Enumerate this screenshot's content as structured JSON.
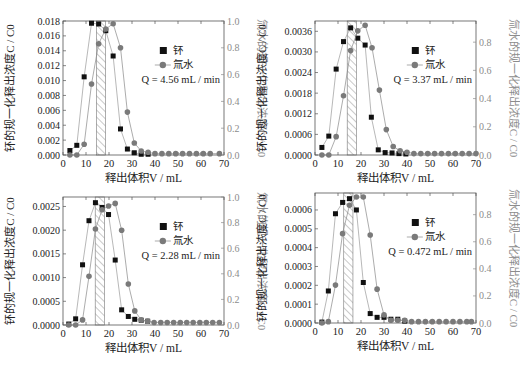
{
  "figure": {
    "x_axis_label": "释出体积V / mL",
    "left_axis_label": "钚的规一化释出浓度C / C0",
    "right_axis_label": "氚水的规一化释出浓度C / C0",
    "legend": [
      "钚",
      "氚水"
    ]
  },
  "chart_data": [
    {
      "type": "scatter",
      "panel": "top-left",
      "annotation": "Q = 4.56 mL / min",
      "xlabel": "释出体积V / mL",
      "ylabel_left": "钚的规一化释出浓度C / C0",
      "ylabel_right": "氚水的规一化释出浓度C / C0",
      "xlim": [
        0,
        70
      ],
      "xticks": [
        0,
        10,
        20,
        30,
        40,
        50,
        60,
        70
      ],
      "ylim_left": [
        0,
        0.018
      ],
      "yticks_left": [
        "0.000",
        "0.002",
        "0.004",
        "0.006",
        "0.008",
        "0.010",
        "0.012",
        "0.014",
        "0.016",
        "0.018"
      ],
      "ylim_right": [
        0,
        1.0
      ],
      "yticks_right": [
        "0.0",
        "0.2",
        "0.4",
        "0.6",
        "0.8",
        "1.0"
      ],
      "hatch_region": [
        14.5,
        18.5
      ],
      "series": [
        {
          "name": "钚",
          "axis": "left",
          "marker": "square",
          "x": [
            3,
            6,
            9.2,
            12.4,
            15.5,
            18.6,
            21.8,
            25,
            28,
            31,
            34,
            37
          ],
          "y": [
            0.0006,
            0.0013,
            0.0105,
            0.0177,
            0.0176,
            0.0167,
            0.0133,
            0.0035,
            0.0008,
            0.0003,
            0.0001,
            0.0001
          ]
        },
        {
          "name": "氚水",
          "axis": "right",
          "marker": "circle",
          "x": [
            3,
            6,
            9.2,
            12.4,
            15.5,
            18.6,
            21.8,
            25,
            28,
            31,
            34,
            37,
            40,
            43,
            46,
            49,
            52,
            55,
            58,
            61,
            64,
            68
          ],
          "y": [
            0.0,
            0.0,
            0.08,
            0.53,
            0.83,
            0.94,
            0.98,
            0.8,
            0.32,
            0.09,
            0.03,
            0.02,
            0.01,
            0.01,
            0.01,
            0.01,
            0.01,
            0.01,
            0.01,
            0.01,
            0.01,
            0.01
          ]
        }
      ]
    },
    {
      "type": "scatter",
      "panel": "top-right",
      "annotation": "Q = 3.37 mL / min",
      "xlabel": "释出体积V / mL",
      "xlim": [
        0,
        70
      ],
      "xticks": [
        0,
        10,
        20,
        30,
        40,
        50,
        60,
        70
      ],
      "ylim_left": [
        0,
        0.0039
      ],
      "yticks_left": [
        "0.0000",
        "0.0006",
        "0.0012",
        "0.0018",
        "0.0024",
        "0.0030",
        "0.0036"
      ],
      "ylim_right": [
        0,
        0.95
      ],
      "yticks_right": [
        "0.0",
        "0.2",
        "0.4",
        "0.6",
        "0.8"
      ],
      "hatch_region": [
        14,
        18
      ],
      "series": [
        {
          "name": "钚",
          "axis": "left",
          "marker": "square",
          "x": [
            3,
            6,
            9.2,
            12.4,
            15.5,
            18.6,
            21.8,
            24.5,
            27.5,
            30.5,
            33.5,
            36.5,
            39.5
          ],
          "y": [
            0.00022,
            0.00055,
            0.0025,
            0.0033,
            0.0037,
            0.0034,
            0.0032,
            0.0011,
            0.00015,
            7e-05,
            6e-05,
            4e-05,
            3e-05
          ]
        },
        {
          "name": "氚水",
          "axis": "right",
          "marker": "circle",
          "x": [
            3,
            6,
            9.2,
            12.4,
            15.5,
            18.6,
            21.8,
            24.8,
            28,
            31,
            34,
            37,
            40,
            43,
            46,
            49,
            52,
            55,
            58,
            61,
            64,
            67,
            70
          ],
          "y": [
            0.0,
            0.0,
            0.13,
            0.42,
            0.74,
            0.88,
            0.92,
            0.76,
            0.46,
            0.18,
            0.06,
            0.03,
            0.02,
            0.01,
            0.01,
            0.01,
            0.01,
            0.01,
            0.01,
            0.01,
            0.01,
            0.01,
            0.01
          ]
        }
      ]
    },
    {
      "type": "scatter",
      "panel": "bottom-left",
      "annotation": "Q = 2.28 mL / min",
      "xlabel": "释出体积V / mL",
      "xlim": [
        0,
        70
      ],
      "xticks": [
        0,
        10,
        20,
        30,
        40,
        50,
        60,
        70
      ],
      "ylim_left": [
        0,
        0.0027
      ],
      "yticks_left": [
        "0.0000",
        "0.0005",
        "0.0010",
        "0.0015",
        "0.0020",
        "0.0025"
      ],
      "ylim_right": [
        0,
        1.0
      ],
      "yticks_right": [
        "0.0",
        "0.2",
        "0.4",
        "0.6",
        "0.8",
        "1.0"
      ],
      "hatch_region": [
        14,
        18
      ],
      "series": [
        {
          "name": "钚",
          "axis": "left",
          "marker": "square",
          "x": [
            2.5,
            5.5,
            8.5,
            11.3,
            14.1,
            17,
            19.8,
            22.7,
            25.5,
            28.4,
            31.2,
            34,
            36.8
          ],
          "y": [
            2e-05,
            0.00013,
            0.00127,
            0.0022,
            0.00258,
            0.00248,
            0.00233,
            0.00137,
            0.00032,
            0.00018,
            0.00012,
            0.0001,
            8e-05
          ]
        },
        {
          "name": "氚水",
          "axis": "right",
          "marker": "circle",
          "x": [
            2.5,
            5.5,
            8.5,
            11.3,
            14.1,
            17,
            19.8,
            22.7,
            25.5,
            28.4,
            31.2,
            34,
            36.8,
            39.6,
            42.5,
            45.3,
            48.1,
            51,
            53.8,
            56.6,
            59.5,
            62.3,
            65.1,
            68
          ],
          "y": [
            0.0,
            0.0,
            0.04,
            0.38,
            0.75,
            0.9,
            0.93,
            0.95,
            0.74,
            0.32,
            0.11,
            0.04,
            0.03,
            0.02,
            0.02,
            0.02,
            0.02,
            0.02,
            0.02,
            0.02,
            0.02,
            0.02,
            0.02,
            0.02
          ]
        }
      ]
    },
    {
      "type": "scatter",
      "panel": "bottom-right",
      "annotation": "Q = 0.472 mL / min",
      "xlabel": "释出体积V / mL",
      "xlim": [
        0,
        70
      ],
      "xticks": [
        0,
        10,
        20,
        30,
        40,
        50,
        60,
        70
      ],
      "ylim_left": [
        0,
        0.00069
      ],
      "yticks_left": [
        "0.0000",
        "0.0001",
        "0.0002",
        "0.0003",
        "0.0004",
        "0.0005",
        "0.0006"
      ],
      "ylim_right": [
        0,
        0.96
      ],
      "yticks_right": [
        "0.0",
        "0.2",
        "0.4",
        "0.6",
        "0.8"
      ],
      "hatch_region": [
        12.5,
        16.5
      ],
      "series": [
        {
          "name": "钚",
          "axis": "left",
          "marker": "square",
          "x": [
            3,
            5.8,
            8.9,
            12,
            15,
            18,
            21,
            24,
            27,
            30,
            33,
            36,
            39
          ],
          "y": [
            5e-06,
            0.00017,
            0.00058,
            0.00064,
            0.00066,
            0.0006,
            0.000215,
            5e-05,
            3e-05,
            3e-05,
            2e-05,
            2e-05,
            1e-05
          ]
        },
        {
          "name": "氚水",
          "axis": "right",
          "marker": "circle",
          "x": [
            3,
            5.8,
            8.9,
            12,
            15,
            18,
            21,
            24,
            27,
            30,
            33,
            36,
            39,
            42,
            45,
            48,
            51,
            54,
            57,
            60,
            63,
            66,
            68
          ],
          "y": [
            0.0,
            0.01,
            0.28,
            0.66,
            0.87,
            0.93,
            0.93,
            0.65,
            0.25,
            0.06,
            0.02,
            0.02,
            0.02,
            0.01,
            0.01,
            0.01,
            0.01,
            0.01,
            0.01,
            0.01,
            0.01,
            0.01,
            0.01
          ]
        }
      ]
    }
  ],
  "colors": {
    "pu": "#111111",
    "tritium": "#7a7a7a",
    "right_axis": "#8c8c8c",
    "frame": "#555555"
  }
}
